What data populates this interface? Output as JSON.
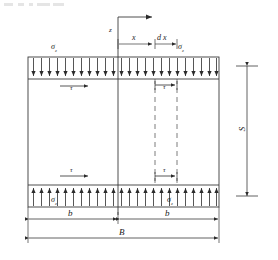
{
  "figure": {
    "caption_top": "",
    "labels": {
      "z_axis": "z",
      "x_axis": "x",
      "dx": "d x",
      "sigma_top_left": "σ",
      "sigma_top_left_sub": "z",
      "sigma_top_right": "σ",
      "sigma_top_right_sub": "z",
      "sigma_bottom_left": "σ",
      "sigma_bottom_left_sub": "z",
      "sigma_bottom_right": "σ",
      "sigma_bottom_right_sub": "z",
      "tau_top_left": "τ",
      "tau_top_right": "τ",
      "tau_bottom_left": "τ",
      "tau_bottom_right": "τ",
      "dim_b_left": "b",
      "dim_b_right": "b",
      "dim_B": "B",
      "dim_S": "S"
    },
    "colors": {
      "line": "#3a3a3a",
      "arrow": "#2b2b2b",
      "dashed": "#5a5a5a",
      "background": "#ffffff"
    },
    "geometry": {
      "frame_left": 28,
      "frame_right": 219,
      "frame_top": 57,
      "frame_bottom": 207,
      "band_height": 22,
      "center_x": 118,
      "dx_left": 155,
      "dx_right": 177,
      "arrow_count_top": 24,
      "arrow_count_bottom": 24
    }
  }
}
